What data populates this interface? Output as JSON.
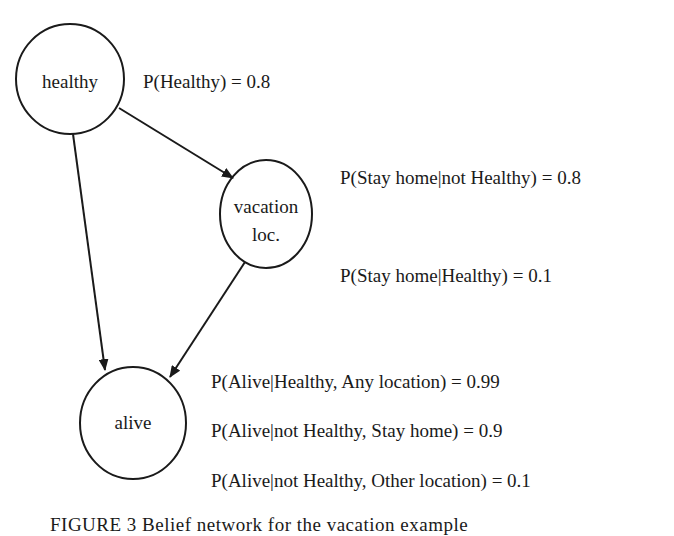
{
  "nodes": {
    "healthy": {
      "label": "healthy"
    },
    "vacation": {
      "line1": "vacation",
      "line2": "loc."
    },
    "alive": {
      "label": "alive"
    }
  },
  "edges": [
    {
      "from": "healthy",
      "to": "vacation loc."
    },
    {
      "from": "healthy",
      "to": "alive"
    },
    {
      "from": "vacation loc.",
      "to": "alive"
    }
  ],
  "probabilities": {
    "healthy": "P(Healthy) = 0.8",
    "vacation": [
      "P(Stay home|not Healthy) = 0.8",
      "P(Stay home|Healthy) = 0.1"
    ],
    "alive": [
      "P(Alive|Healthy, Any location) = 0.99",
      "P(Alive|not Healthy, Stay home) = 0.9",
      "P(Alive|not Healthy, Other location) = 0.1"
    ]
  },
  "caption": "FIGURE 3  Belief network for the vacation example"
}
